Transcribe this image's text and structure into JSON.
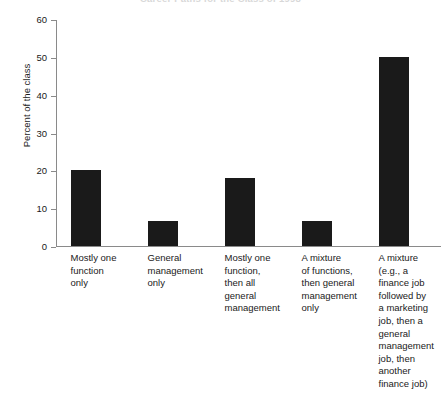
{
  "chart_data": {
    "type": "bar",
    "title": "Career Paths for the Class of 1998",
    "xlabel": "",
    "ylabel": "Percent of the class",
    "ylim": [
      0,
      60
    ],
    "yticks": [
      "0",
      "10",
      "20",
      "30",
      "40",
      "50",
      "60"
    ],
    "grid": false,
    "legend": null,
    "bar_color": "#1a1a1a",
    "categories": [
      "Mostly one function only",
      "General management only",
      "Mostly one function, then all general management",
      "A mixture of functions, then general management only",
      "A mixture (e.g., a finance job followed by a marketing job, then a general management job, then another finance job)"
    ],
    "category_lines": [
      [
        "Mostly one",
        "function",
        "only"
      ],
      [
        "General",
        "management",
        "only"
      ],
      [
        "Mostly one",
        "function,",
        "then all",
        "general",
        "management"
      ],
      [
        "A mixture",
        "of functions,",
        "then general",
        "management",
        "only"
      ],
      [
        "A mixture",
        "(e.g., a",
        "finance job",
        "followed by",
        "a marketing",
        "job, then a",
        "general",
        "management",
        "job, then",
        "another",
        "finance job)"
      ]
    ],
    "values": [
      20,
      6.7,
      18,
      6.7,
      50
    ]
  }
}
